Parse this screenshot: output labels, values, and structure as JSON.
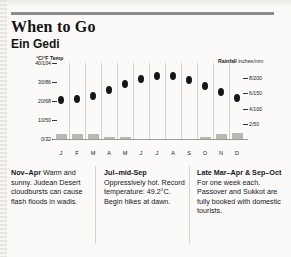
{
  "header": {
    "title": "When to Go",
    "subtitle": "Ein Gedi"
  },
  "chart_data": {
    "type": "line",
    "title": "When to Go",
    "subtitle": "Ein Gedi",
    "categories": [
      "J",
      "F",
      "M",
      "A",
      "M",
      "J",
      "J",
      "A",
      "S",
      "O",
      "N",
      "D"
    ],
    "month_labels": [
      "J",
      "F",
      "M",
      "A",
      "M",
      "J",
      "J",
      "A",
      "S",
      "O",
      "N",
      "D"
    ],
    "temp_axis_title": "°C/°F Temp",
    "rain_axis_title": "Rainfall",
    "rain_axis_unit": "inches/mm",
    "temp_ticks": [
      "40/104",
      "30/86",
      "20/68",
      "10/50",
      "0/32"
    ],
    "temp_tick_values": [
      40,
      30,
      20,
      10,
      0
    ],
    "rain_ticks": [
      "8/200",
      "6/150",
      "4/100",
      "2/50"
    ],
    "rain_tick_values": [
      8,
      6,
      4,
      2
    ],
    "ylim_temp": [
      0,
      40
    ],
    "ylim_rain": [
      0,
      10
    ],
    "grid": true,
    "legend": "none",
    "series": [
      {
        "name": "Temperature",
        "unit": "°C",
        "marker": "dot",
        "values": [
          20.5,
          21,
          22.5,
          26,
          29,
          31.5,
          33,
          33,
          31,
          28,
          25,
          21.5
        ]
      },
      {
        "name": "Rainfall",
        "unit": "inches",
        "marker": "bar",
        "values": [
          0.45,
          0.45,
          0.4,
          0.12,
          0.02,
          0,
          0,
          0,
          0,
          0.1,
          0.45,
          0.55
        ]
      }
    ]
  },
  "notes": [
    {
      "heading": "Nov–Apr",
      "body": " Warm and sunny. Judean Desert cloudbursts can cause flash floods in wadis."
    },
    {
      "heading": "Jul–mid-Sep",
      "body": " Oppressively hot. Record temperature: 49.2°C. Begin hikes at dawn."
    },
    {
      "heading": "Late Mar–Apr & Sep–Oct",
      "body": " For one week each. Passover and Sukkot are fully booked with domestic tourists."
    }
  ]
}
